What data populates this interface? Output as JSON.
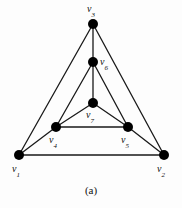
{
  "figure": {
    "caption": "(a)",
    "background_color": "#fdfdfd",
    "stroke_color": "#1a1a1a",
    "vertex_fill_color": "#000000",
    "label_color": "#111111"
  },
  "graph": {
    "type": "undirected-graph",
    "vertex_count": 7,
    "edge_count": 12,
    "vertices": [
      {
        "id": "v1",
        "label": "v",
        "subscript": "1",
        "x": 19,
        "y": 155,
        "label_x": 12,
        "label_y": 164
      },
      {
        "id": "v2",
        "label": "v",
        "subscript": "2",
        "x": 164,
        "y": 155,
        "label_x": 157,
        "label_y": 164
      },
      {
        "id": "v3",
        "label": "v",
        "subscript": "3",
        "x": 93,
        "y": 24,
        "label_x": 87,
        "label_y": 4
      },
      {
        "id": "v4",
        "label": "v",
        "subscript": "4",
        "x": 56,
        "y": 127,
        "label_x": 49,
        "label_y": 135
      },
      {
        "id": "v5",
        "label": "v",
        "subscript": "5",
        "x": 128,
        "y": 127,
        "label_x": 121,
        "label_y": 135
      },
      {
        "id": "v6",
        "label": "v",
        "subscript": "6",
        "x": 93,
        "y": 62,
        "label_x": 100,
        "label_y": 57
      },
      {
        "id": "v7",
        "label": "v",
        "subscript": "7",
        "x": 93,
        "y": 103,
        "label_x": 86,
        "label_y": 110
      }
    ],
    "edges": [
      {
        "from": "v1",
        "to": "v2"
      },
      {
        "from": "v1",
        "to": "v3"
      },
      {
        "from": "v2",
        "to": "v3"
      },
      {
        "from": "v1",
        "to": "v4"
      },
      {
        "from": "v2",
        "to": "v5"
      },
      {
        "from": "v3",
        "to": "v6"
      },
      {
        "from": "v4",
        "to": "v5"
      },
      {
        "from": "v4",
        "to": "v7"
      },
      {
        "from": "v5",
        "to": "v7"
      },
      {
        "from": "v4",
        "to": "v6"
      },
      {
        "from": "v5",
        "to": "v6"
      },
      {
        "from": "v6",
        "to": "v7"
      }
    ]
  }
}
